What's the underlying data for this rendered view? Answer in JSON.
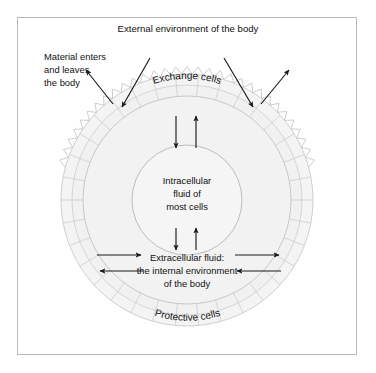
{
  "diagram": {
    "title": "External environment of the body",
    "labels": {
      "material": [
        "Material enters",
        "and leaves",
        "the body"
      ],
      "exchange_cells": "Exchange cells",
      "protective_cells": "Protective cells",
      "intracellular": [
        "Intracellular",
        "fluid of",
        "most cells"
      ],
      "extracellular": [
        "Extracellular fluid:",
        "the internal environment",
        "of the body"
      ]
    },
    "colors": {
      "frame_border": "#b9b9b9",
      "background": "#ffffff",
      "cell_outline": "#c9c9c9",
      "cell_fill": "#f3f3f3",
      "interior_fill": "#f2f2f2",
      "inner_circle_outline": "#b5b5b5",
      "arrow": "#1a1a1a",
      "text": "#111111"
    },
    "geometry": {
      "center_x": 187,
      "center_y": 200,
      "outer_radius": 126,
      "inner_ring_radius": 104,
      "inner_circle_radius": 55,
      "microvilli_arc_degrees": 150,
      "cell_segment_count": 34
    },
    "arrows": {
      "exchange_in_left": "inward-down-right",
      "exchange_in_right": "inward-down-left",
      "exchange_out_left": "outward-up-left",
      "exchange_out_right": "outward-up-right",
      "cell_down": "down",
      "cell_up": "up",
      "ecf_in_left": "right",
      "ecf_out_left": "left",
      "ecf_out_right": "right",
      "ecf_in_right": "left"
    }
  }
}
